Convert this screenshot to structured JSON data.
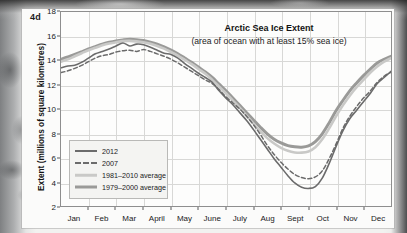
{
  "panel": {
    "letter": "4d"
  },
  "chart_data": {
    "type": "line",
    "title": "Arctic Sea Ice Extent",
    "subtitle": "(area of ocean with at least 15% sea ice)",
    "xlabel": "",
    "ylabel": "Extent (millions of square kilometres)",
    "ylim": [
      2,
      18
    ],
    "xlim": [
      0,
      12
    ],
    "grid": true,
    "legend_position": "lower-left",
    "y_ticks": [
      2,
      4,
      6,
      8,
      10,
      12,
      14,
      16,
      18
    ],
    "x_tick_labels": [
      "Jan",
      "Feb",
      "Mar",
      "April",
      "May",
      "June",
      "July",
      "Aug",
      "Sept",
      "Oct",
      "Nov",
      "Dec"
    ],
    "x_month_centers": [
      0.5,
      1.5,
      2.5,
      3.5,
      4.5,
      5.5,
      6.5,
      7.5,
      8.5,
      9.5,
      10.5,
      11.5
    ],
    "x": [
      0.0,
      0.25,
      0.5,
      0.75,
      1.0,
      1.25,
      1.5,
      1.75,
      2.0,
      2.25,
      2.5,
      2.75,
      3.0,
      3.25,
      3.5,
      3.75,
      4.0,
      4.25,
      4.5,
      4.75,
      5.0,
      5.25,
      5.5,
      5.75,
      6.0,
      6.25,
      6.5,
      6.75,
      7.0,
      7.25,
      7.5,
      7.75,
      8.0,
      8.25,
      8.5,
      8.75,
      9.0,
      9.25,
      9.5,
      9.75,
      10.0,
      10.25,
      10.5,
      10.75,
      11.0,
      11.25,
      11.5,
      11.75,
      12.0
    ],
    "series": [
      {
        "name": "2012",
        "style": "solid",
        "color": "#6b6b6b",
        "width": 1.6,
        "values": [
          13.4,
          13.55,
          13.6,
          13.85,
          14.2,
          14.55,
          14.75,
          14.95,
          15.2,
          15.45,
          15.2,
          15.35,
          15.3,
          15.1,
          14.85,
          14.6,
          14.5,
          14.2,
          13.75,
          13.35,
          12.95,
          12.6,
          12.2,
          11.5,
          10.9,
          10.35,
          9.7,
          9.05,
          8.3,
          7.5,
          6.7,
          5.9,
          5.2,
          4.5,
          3.9,
          3.55,
          3.45,
          3.6,
          4.3,
          5.5,
          6.9,
          8.2,
          9.2,
          9.9,
          10.6,
          11.3,
          12.1,
          12.6,
          13.1
        ]
      },
      {
        "name": "2007",
        "style": "dashed",
        "color": "#6b6b6b",
        "width": 1.5,
        "values": [
          13.0,
          13.15,
          13.35,
          13.6,
          13.9,
          14.2,
          14.4,
          14.5,
          14.7,
          14.8,
          14.85,
          14.75,
          14.9,
          14.75,
          14.55,
          14.35,
          14.1,
          13.8,
          13.45,
          13.1,
          12.75,
          12.4,
          12.1,
          11.6,
          11.0,
          10.5,
          10.0,
          9.4,
          8.7,
          7.9,
          7.0,
          6.25,
          5.6,
          5.05,
          4.6,
          4.35,
          4.25,
          4.4,
          4.9,
          5.9,
          7.1,
          8.4,
          9.4,
          10.2,
          10.9,
          11.5,
          12.2,
          12.7,
          13.05
        ]
      },
      {
        "name": "1981–2010 average",
        "style": "solid",
        "color": "#c9c9c7",
        "width": 2.6,
        "values": [
          13.9,
          14.1,
          14.35,
          14.6,
          14.85,
          15.05,
          15.25,
          15.4,
          15.5,
          15.6,
          15.62,
          15.58,
          15.5,
          15.38,
          15.2,
          14.98,
          14.7,
          14.4,
          14.05,
          13.7,
          13.3,
          12.9,
          12.4,
          11.85,
          11.3,
          10.7,
          10.1,
          9.45,
          8.8,
          8.15,
          7.6,
          7.15,
          6.8,
          6.55,
          6.42,
          6.4,
          6.5,
          6.85,
          7.5,
          8.4,
          9.4,
          10.3,
          11.1,
          11.8,
          12.4,
          13.0,
          13.5,
          13.9,
          14.2
        ]
      },
      {
        "name": "1979–2000 average",
        "style": "solid",
        "color": "#9a9a98",
        "width": 3.0,
        "values": [
          14.1,
          14.3,
          14.5,
          14.72,
          14.95,
          15.15,
          15.35,
          15.5,
          15.62,
          15.7,
          15.75,
          15.72,
          15.65,
          15.52,
          15.35,
          15.12,
          14.85,
          14.55,
          14.2,
          13.85,
          13.45,
          13.05,
          12.6,
          12.05,
          11.5,
          10.9,
          10.3,
          9.7,
          9.1,
          8.5,
          7.95,
          7.5,
          7.2,
          6.98,
          6.88,
          6.85,
          6.95,
          7.3,
          7.95,
          8.85,
          9.85,
          10.7,
          11.5,
          12.15,
          12.75,
          13.3,
          13.8,
          14.1,
          14.35
        ]
      }
    ]
  }
}
